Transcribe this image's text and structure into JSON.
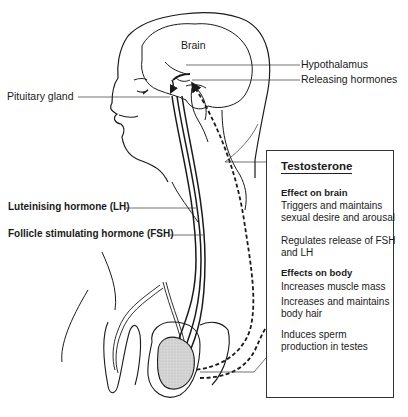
{
  "diagram": {
    "labels": {
      "brain": "Brain",
      "hypothalamus": "Hypothalamus",
      "releasing_hormones": "Releasing hormones",
      "pituitary_gland": "Pituitary gland",
      "lh": "Luteinising hormone (LH)",
      "fsh": "Follicle stimulating hormone (FSH)"
    },
    "testosterone_box": {
      "title": "Testosterone",
      "brain_section": {
        "heading": "Effect on brain",
        "items": [
          "Triggers and maintains sexual desire and arousal",
          "Regulates release of FSH and LH"
        ]
      },
      "body_section": {
        "heading": "Effects on body",
        "items": [
          "Increases muscle mass",
          "Increases and maintains body hair",
          "Induces sperm production in testes"
        ]
      }
    },
    "colors": {
      "line": "#1a1a1a",
      "testis_fill": "#d9d9d9",
      "background": "#ffffff"
    }
  }
}
